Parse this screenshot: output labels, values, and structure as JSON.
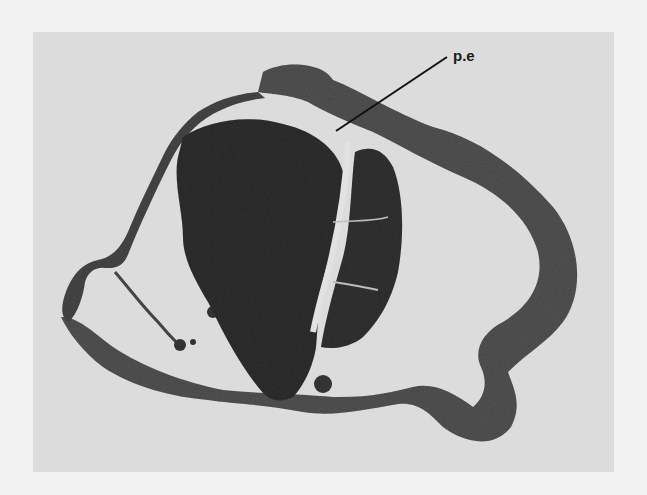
{
  "figure": {
    "type": "histological micrograph",
    "tone": "grayscale",
    "labels": [
      {
        "text": "p.e",
        "x": 453,
        "y": 48
      }
    ]
  },
  "colors": {
    "page": "#f2f2f2",
    "plate_background": "#dcdcdc",
    "dense_tissue": "#3a3a3a",
    "wall_tissue": "#5a5a5a",
    "lumen": "#e6e6e6"
  }
}
